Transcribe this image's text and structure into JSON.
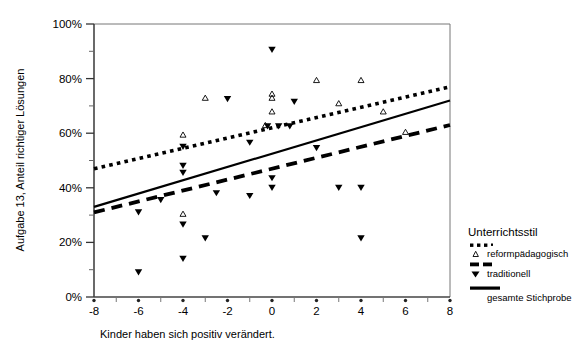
{
  "chart_data": {
    "type": "scatter",
    "title": "",
    "xlabel": "Kinder haben sich positiv verändert.",
    "ylabel": "Aufgabe 13, Anteil richtiger Lösungen",
    "xlim": [
      -8,
      8
    ],
    "ylim": [
      0,
      100
    ],
    "grid": false,
    "x_ticks": [
      -8,
      -6,
      -4,
      -2,
      0,
      2,
      4,
      6,
      8
    ],
    "x_tick_labels": [
      "-8",
      "-6",
      "-4",
      "-2",
      "0",
      "2",
      "4",
      "6",
      "8"
    ],
    "x_minor_ticks": [
      -7,
      -5,
      -3,
      -1,
      1,
      3,
      5,
      7
    ],
    "y_ticks": [
      0,
      20,
      40,
      60,
      80,
      100
    ],
    "y_tick_labels": [
      "0%",
      "20%",
      "40%",
      "60%",
      "80%",
      "100%"
    ],
    "legend_position": "right",
    "legend_title": "Unterrichtsstil",
    "series": [
      {
        "name": "reformpädagogisch",
        "marker": "triangle-up-open",
        "points": [
          [
            -4.0,
            59.5
          ],
          [
            -3.0,
            73.0
          ],
          [
            -4.0,
            30.5
          ],
          [
            -0.3,
            63.0
          ],
          [
            0.0,
            74.5
          ],
          [
            0.0,
            73.0
          ],
          [
            0.0,
            68.0
          ],
          [
            2.0,
            79.5
          ],
          [
            3.0,
            71.0
          ],
          [
            4.0,
            79.5
          ],
          [
            5.0,
            68.0
          ],
          [
            6.0,
            60.5
          ]
        ]
      },
      {
        "name": "traditionell",
        "marker": "triangle-down-filled",
        "points": [
          [
            0.0,
            90.5
          ],
          [
            -2.0,
            72.5
          ],
          [
            1.0,
            71.5
          ],
          [
            -4.0,
            55.0
          ],
          [
            -4.0,
            48.0
          ],
          [
            -4.0,
            45.5
          ],
          [
            -0.2,
            62.5
          ],
          [
            0.3,
            62.5
          ],
          [
            0.8,
            62.5
          ],
          [
            -1.0,
            56.5
          ],
          [
            2.0,
            54.5
          ],
          [
            -6.0,
            31.0
          ],
          [
            -5.0,
            35.5
          ],
          [
            -2.5,
            38.0
          ],
          [
            0.0,
            43.5
          ],
          [
            0.0,
            40.0
          ],
          [
            -1.0,
            37.0
          ],
          [
            3.0,
            40.0
          ],
          [
            4.0,
            40.0
          ],
          [
            -4.0,
            26.5
          ],
          [
            -3.0,
            21.5
          ],
          [
            4.0,
            21.5
          ],
          [
            -4.0,
            14.0
          ],
          [
            -6.0,
            9.0
          ]
        ]
      }
    ],
    "trend_lines": [
      {
        "name": "reformpädagogisch",
        "style": "dotted",
        "x_start": -8,
        "y_start": 47.0,
        "x_end": 8,
        "y_end": 77.0
      },
      {
        "name": "traditionell",
        "style": "dashed",
        "x_start": -8,
        "y_start": 31.0,
        "x_end": 8,
        "y_end": 63.0
      },
      {
        "name": "gesamte Stichprobe",
        "style": "solid",
        "x_start": -8,
        "y_start": 33.0,
        "x_end": 8,
        "y_end": 72.0
      }
    ]
  },
  "legend": {
    "title": "Unterrichtsstil",
    "items": [
      {
        "label": "reformpädagogisch",
        "style": "dotted",
        "marker": "triangle-up-open"
      },
      {
        "label": "traditionell",
        "style": "dashed",
        "marker": "triangle-down-filled"
      },
      {
        "label": "gesamte Stichprobe",
        "style": "solid",
        "marker": "none"
      }
    ]
  },
  "axes": {
    "y_label": "Aufgabe 13, Anteil richtiger Lösungen",
    "x_label": "Kinder haben sich positiv verändert.",
    "y_tick_labels": [
      "100%",
      "80%",
      "60%",
      "40%",
      "20%",
      "0%"
    ],
    "x_tick_labels": [
      "-8",
      "-6",
      "-4",
      "-2",
      "0",
      "2",
      "4",
      "6",
      "8"
    ]
  },
  "colors": {
    "foreground": "#000000",
    "background": "#ffffff",
    "axis": "#555555"
  }
}
